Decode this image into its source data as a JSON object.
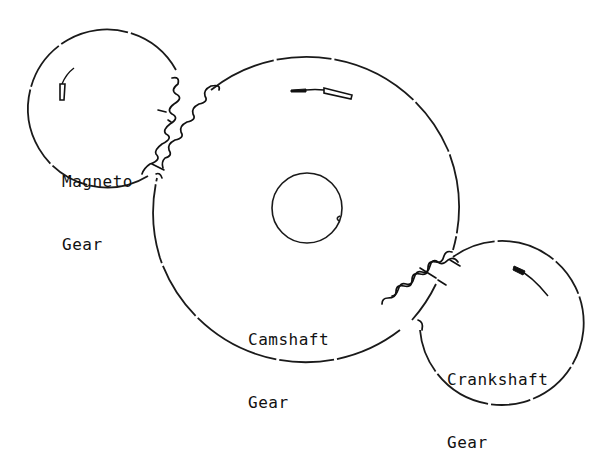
{
  "diagram": {
    "colors": {
      "line": "#1a1a1a",
      "background": "#ffffff"
    },
    "gears": [
      {
        "id": "magneto",
        "label_line1": "Magneto",
        "label_line2": "Gear",
        "center": [
          104,
          108
        ],
        "radius": 79,
        "rotation_arrow": "clockwise-arc"
      },
      {
        "id": "camshaft",
        "label_line1": "Camshaft",
        "label_line2": "Gear",
        "center": [
          307,
          208
        ],
        "radius": 154,
        "hub_radius": 36,
        "rotation_arrow": "counter-clockwise-arc"
      },
      {
        "id": "crankshaft",
        "label_line1": "Crankshaft",
        "label_line2": "Gear",
        "center": [
          499,
          328
        ],
        "radius": 82,
        "rotation_arrow": "clockwise-arc"
      }
    ],
    "meshes": [
      {
        "between": [
          "magneto",
          "camshaft"
        ],
        "location": [
          160,
          130
        ]
      },
      {
        "between": [
          "camshaft",
          "crankshaft"
        ],
        "location": [
          428,
          290
        ]
      }
    ]
  }
}
